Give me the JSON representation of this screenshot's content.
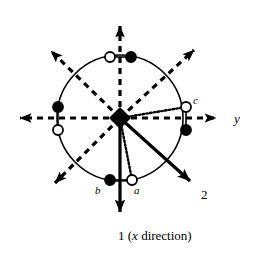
{
  "figure": {
    "name": "stereographic-projection-symmetry-diagram",
    "background_color": "#ffffff",
    "stroke_color": "#000000",
    "center": {
      "x": 120,
      "y": 118
    },
    "circle_radius": 63,
    "labels": {
      "a": "a",
      "b": "b",
      "c": "c",
      "y_axis": "y",
      "axis_2": "2",
      "x_direction": "1 (x direction)"
    },
    "axes": [
      {
        "name": "vertical-dashed-up-axis",
        "style": "dashed",
        "from": {
          "x": 120,
          "y": 118
        },
        "to": {
          "x": 120,
          "y": 14
        },
        "arrow": true
      },
      {
        "name": "horizontal-dashed-right-axis",
        "style": "dashed",
        "label": "y",
        "from": {
          "x": 120,
          "y": 118
        },
        "to": {
          "x": 228,
          "y": 118
        },
        "arrow": true
      },
      {
        "name": "horizontal-dashed-left-axis",
        "style": "dashed",
        "from": {
          "x": 120,
          "y": 118
        },
        "to": {
          "x": 8,
          "y": 118
        },
        "arrow": true
      },
      {
        "name": "diagonal-dashed-upper-left-axis",
        "style": "dashed",
        "from": {
          "x": 120,
          "y": 118
        },
        "to": {
          "x": 42,
          "y": 42
        },
        "arrow": true
      },
      {
        "name": "diagonal-dashed-upper-right-axis",
        "style": "dashed",
        "from": {
          "x": 120,
          "y": 118
        },
        "to": {
          "x": 203,
          "y": 41
        },
        "arrow": true
      },
      {
        "name": "diagonal-dashed-lower-left-axis",
        "style": "dashed",
        "from": {
          "x": 120,
          "y": 118
        },
        "to": {
          "x": 46,
          "y": 192
        },
        "arrow": true
      },
      {
        "name": "vertical-solid-down-axis-1",
        "style": "solid",
        "label": "1 (x direction)",
        "from": {
          "x": 120,
          "y": 118
        },
        "to": {
          "x": 120,
          "y": 226
        },
        "arrow": true
      },
      {
        "name": "diagonal-solid-lower-right-axis-2",
        "style": "solid",
        "label": "2",
        "from": {
          "x": 120,
          "y": 118
        },
        "to": {
          "x": 200,
          "y": 190
        },
        "arrow": true
      }
    ],
    "dotted_connectors": [
      {
        "name": "dotted-line-center-to-c",
        "from": {
          "x": 120,
          "y": 118
        },
        "to": {
          "x": 186,
          "y": 107
        }
      },
      {
        "name": "dotted-line-center-to-a",
        "from": {
          "x": 120,
          "y": 118
        },
        "to": {
          "x": 132,
          "y": 180
        }
      }
    ],
    "chord_connectors": [
      {
        "name": "chord-top-pair",
        "from": {
          "x": 110,
          "y": 57
        },
        "to": {
          "x": 131,
          "y": 57
        }
      },
      {
        "name": "chord-bottom-pair",
        "from": {
          "x": 110,
          "y": 180
        },
        "to": {
          "x": 132,
          "y": 180
        }
      },
      {
        "name": "chord-left-pair",
        "from": {
          "x": 58,
          "y": 107
        },
        "to": {
          "x": 58,
          "y": 130
        }
      },
      {
        "name": "chord-right-pair",
        "from": {
          "x": 186,
          "y": 107
        },
        "to": {
          "x": 186,
          "y": 130
        }
      }
    ],
    "center_marker": {
      "name": "center-diamond-marker",
      "shape": "diamond",
      "fill": "filled",
      "x": 120,
      "y": 118,
      "size": 11
    },
    "points": [
      {
        "name": "point-top-open",
        "fill": "open",
        "x": 110,
        "y": 57,
        "label": ""
      },
      {
        "name": "point-top-filled",
        "fill": "filled",
        "x": 131,
        "y": 57,
        "label": ""
      },
      {
        "name": "point-left-filled",
        "fill": "filled",
        "x": 58,
        "y": 107,
        "label": ""
      },
      {
        "name": "point-left-open",
        "fill": "open",
        "x": 58,
        "y": 130,
        "label": ""
      },
      {
        "name": "point-right-open-c",
        "fill": "open",
        "x": 186,
        "y": 107,
        "label": "c"
      },
      {
        "name": "point-right-filled",
        "fill": "filled",
        "x": 186,
        "y": 130,
        "label": ""
      },
      {
        "name": "point-bottom-filled-b",
        "fill": "filled",
        "x": 110,
        "y": 180,
        "label": "b"
      },
      {
        "name": "point-bottom-open-a",
        "fill": "open",
        "x": 132,
        "y": 180,
        "label": "a"
      }
    ]
  }
}
